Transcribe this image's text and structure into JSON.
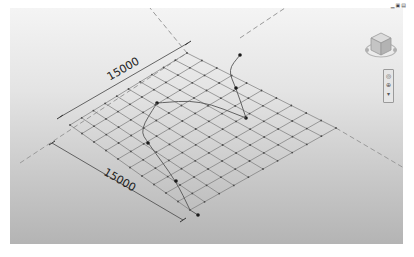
{
  "window": {
    "controls": [
      {
        "name": "minimize",
        "glyph": "▁"
      },
      {
        "name": "restore",
        "glyph": "▣"
      },
      {
        "name": "close",
        "glyph": "▤"
      }
    ]
  },
  "viewport": {
    "background_top": "#f4f4f4",
    "background_bottom": "#b4b4b4",
    "grid": {
      "divisions": 10,
      "corners": {
        "left": [
          70,
          125
        ],
        "top": [
          187,
          53
        ],
        "right": [
          336,
          128
        ],
        "bottom": [
          190,
          210
        ]
      },
      "line_color": "#7a7a7a",
      "node_color": "#4a4a4a"
    },
    "dimensions": [
      {
        "label": "15000",
        "from": [
          60,
          117
        ],
        "to": [
          188,
          43
        ],
        "text_pos": [
          125,
          72
        ],
        "angle": -30
      },
      {
        "label": "15000",
        "from": [
          52,
          143
        ],
        "to": [
          183,
          220
        ],
        "text_pos": [
          118,
          183
        ],
        "angle": 30
      }
    ],
    "reference_planes": [
      {
        "from": [
          20,
          163
        ],
        "to": [
          187,
          53
        ],
        "dashed": true
      },
      {
        "from": [
          187,
          53
        ],
        "to": [
          150,
          8
        ],
        "dashed": true
      },
      {
        "from": [
          336,
          128
        ],
        "to": [
          404,
          168
        ],
        "dashed": true
      },
      {
        "from": [
          240,
          38
        ],
        "to": [
          285,
          8
        ],
        "dashed": true
      }
    ],
    "curves": [
      {
        "points": [
          [
            240,
            55
          ],
          [
            228,
            70
          ],
          [
            236,
            88
          ],
          [
            246,
            118
          ]
        ],
        "control_points": [
          [
            240,
            55
          ],
          [
            236,
            88
          ],
          [
            246,
            118
          ]
        ]
      },
      {
        "points": [
          [
            157,
            103
          ],
          [
            200,
            100
          ],
          [
            246,
            118
          ]
        ],
        "control_points": [
          [
            157,
            103
          ]
        ]
      },
      {
        "points": [
          [
            157,
            103
          ],
          [
            140,
            130
          ],
          [
            148,
            143
          ],
          [
            176,
            181
          ],
          [
            190,
            210
          ]
        ],
        "control_points": [
          [
            148,
            143
          ],
          [
            176,
            181
          ]
        ]
      },
      {
        "points": [
          [
            190,
            210
          ],
          [
            198,
            215
          ]
        ],
        "control_points": [
          [
            198,
            215
          ]
        ]
      }
    ]
  },
  "viewcube": {
    "label": "view-cube"
  },
  "navigation_bar": {
    "items": [
      {
        "name": "steering-wheel",
        "glyph": "◎"
      },
      {
        "name": "zoom",
        "glyph": "⊕"
      },
      {
        "name": "more",
        "glyph": "▾"
      }
    ]
  }
}
